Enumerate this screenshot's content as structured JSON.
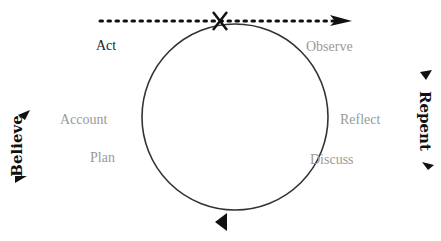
{
  "diagram": {
    "type": "cycle",
    "stages": [
      {
        "label": "Act",
        "emphasis": "dark"
      },
      {
        "label": "Observe",
        "emphasis": "muted"
      },
      {
        "label": "Reflect",
        "emphasis": "muted"
      },
      {
        "label": "Discuss",
        "emphasis": "muted"
      },
      {
        "label": "Plan",
        "emphasis": "muted"
      },
      {
        "label": "Account",
        "emphasis": "muted"
      }
    ],
    "left_side_label": "Believe",
    "right_side_label": "Repent",
    "colors": {
      "circle": "#333333",
      "muted_text": "#9a9a9a",
      "dark_text": "#222222"
    }
  }
}
